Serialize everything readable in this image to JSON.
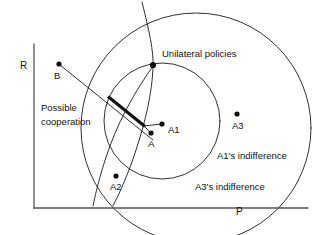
{
  "figure": {
    "type": "diagram",
    "background_color": "#ffffff",
    "stroke_color": "#1a1a1a",
    "axes": {
      "vertical_label": "R",
      "horizontal_label": "P",
      "origin": [
        34,
        208
      ]
    },
    "labels": {
      "unilateral_policies": "Unilateral policies",
      "possible_line1": "Possible",
      "possible_line2": "cooperation",
      "a1_indifference": "A1's indifference",
      "a3_indifference": "A3's indifference"
    },
    "points": [
      {
        "id": "B",
        "label": "B",
        "x": 59,
        "y": 64
      },
      {
        "id": "U",
        "label": "",
        "x": 153,
        "y": 65
      },
      {
        "id": "A1",
        "label": "A1",
        "x": 162,
        "y": 124
      },
      {
        "id": "A",
        "label": "A",
        "x": 151,
        "y": 133
      },
      {
        "id": "A3",
        "label": "A3",
        "x": 237,
        "y": 114
      },
      {
        "id": "A2",
        "label": "A2",
        "x": 116,
        "y": 176
      }
    ],
    "shapes": {
      "a1_circle": {
        "cx": 162,
        "cy": 121,
        "r": 58
      },
      "a3_circle": {
        "cx": 196,
        "cy": 128,
        "r": 115
      },
      "steep_curve": "through unilateral point",
      "thick_segment": {
        "x1": 108,
        "y1": 97,
        "x2": 144,
        "y2": 126
      },
      "b_line": {
        "x1": 60,
        "y1": 65,
        "x2": 153,
        "y2": 140
      }
    }
  }
}
